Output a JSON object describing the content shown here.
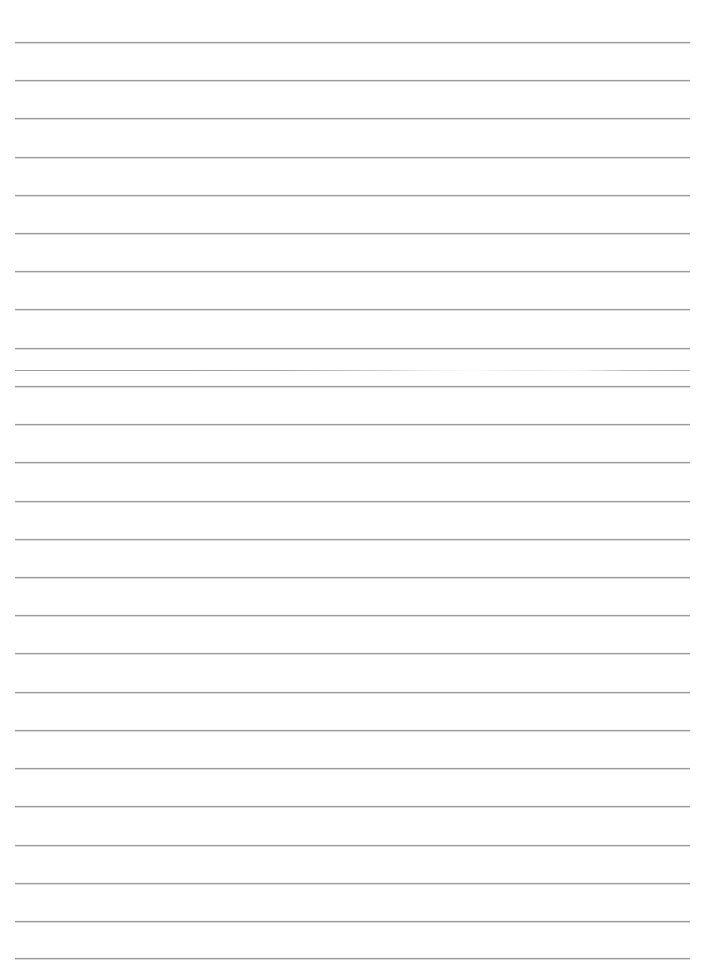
{
  "document": {
    "kind": "ruled-paper-sheet",
    "title": "Lined Notebook Page",
    "page_width": 702,
    "page_height": 965,
    "background_color": "#ffffff",
    "content_text": ""
  },
  "rules": {
    "label": "Horizontal ruled lines",
    "count": 25,
    "color": "#9c9c9c",
    "thickness_px": 1,
    "left_x": 15,
    "right_x": 690,
    "line_width": 675,
    "first_line_y": 42,
    "spacing_px": 38.2,
    "faded_line_index": 9,
    "positions_y": [
      42,
      80,
      118,
      157,
      195,
      233,
      271,
      309,
      348,
      370,
      386,
      424,
      462,
      501,
      539,
      577,
      615,
      653,
      692,
      730,
      768,
      806,
      845,
      883,
      921,
      958
    ]
  },
  "margins": {
    "left_px": 15,
    "right_px": 12,
    "top_px": 42,
    "bottom_px": 7
  }
}
